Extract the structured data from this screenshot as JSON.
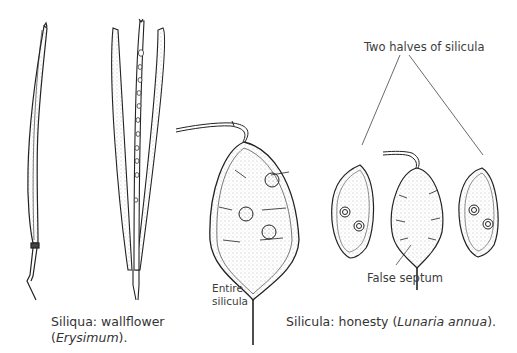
{
  "figure": {
    "left_caption": {
      "line1": "Siliqua: wallflower",
      "line2_open": "(",
      "line2_italic": "Erysimum",
      "line2_close": ")."
    },
    "right_caption": {
      "prefix": "Silicula: honesty (",
      "italic": "Lunaria annua",
      "suffix": ")."
    },
    "labels": {
      "two_halves": "Two halves of silicula",
      "entire_line1": "Entire",
      "entire_line2": "silicula",
      "false_septum": "False septum"
    },
    "illustrations": [
      "closed siliqua (wallflower)",
      "opened siliqua showing seeds on replum",
      "entire silicula (honesty)",
      "left half of silicula with seeds",
      "false septum",
      "right half of silicula with seeds"
    ]
  }
}
